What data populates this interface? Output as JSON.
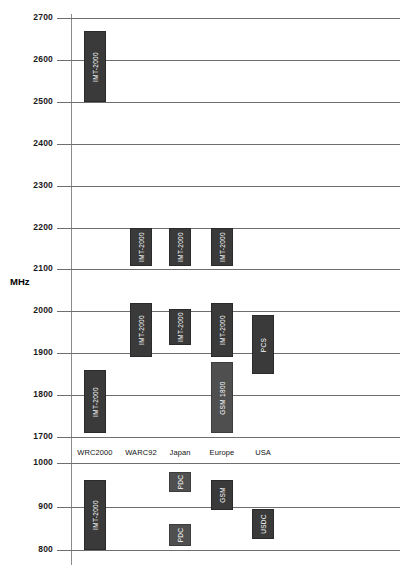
{
  "chart_data": {
    "type": "bar",
    "title": "",
    "xlabel": "",
    "ylabel": "MHz",
    "grid": true,
    "legend": "none",
    "orientation": "vertical-range-bars",
    "categories": [
      "WRC2000",
      "WARC92",
      "Japan",
      "Europe",
      "USA"
    ],
    "panels": [
      {
        "name": "upper",
        "ylim": [
          1700,
          2700
        ],
        "ticks": [
          1700,
          1800,
          1900,
          2000,
          2100,
          2200,
          2300,
          2400,
          2500,
          2600,
          2700
        ]
      },
      {
        "name": "lower",
        "ylim": [
          800,
          1000
        ],
        "ticks": [
          800,
          900,
          1000
        ]
      }
    ],
    "bars": [
      {
        "category": "WRC2000",
        "panel": "upper",
        "label": "IMT-2000",
        "low": 2500,
        "high": 2670,
        "shade": "dark"
      },
      {
        "category": "WRC2000",
        "panel": "upper",
        "label": "IMT-2000",
        "low": 1710,
        "high": 1860,
        "shade": "dark"
      },
      {
        "category": "WARC92",
        "panel": "upper",
        "label": "IMT-2000",
        "low": 2110,
        "high": 2200,
        "shade": "dark"
      },
      {
        "category": "WARC92",
        "panel": "upper",
        "label": "IMT-2000",
        "low": 1890,
        "high": 2020,
        "shade": "dark"
      },
      {
        "category": "Japan",
        "panel": "upper",
        "label": "IMT-2000",
        "low": 2110,
        "high": 2200,
        "shade": "dark"
      },
      {
        "category": "Japan",
        "panel": "upper",
        "label": "IMT-2000",
        "low": 1920,
        "high": 2005,
        "shade": "dark"
      },
      {
        "category": "Europe",
        "panel": "upper",
        "label": "IMT-2000",
        "low": 2110,
        "high": 2200,
        "shade": "dark"
      },
      {
        "category": "Europe",
        "panel": "upper",
        "label": "IMT-2000",
        "low": 1890,
        "high": 2020,
        "shade": "dark"
      },
      {
        "category": "Europe",
        "panel": "upper",
        "label": "GSM 1800",
        "low": 1710,
        "high": 1880,
        "shade": "light"
      },
      {
        "category": "USA",
        "panel": "upper",
        "label": "PCS",
        "low": 1850,
        "high": 1990,
        "shade": "dark"
      },
      {
        "category": "WRC2000",
        "panel": "lower",
        "label": "IMT-2000",
        "low": 800,
        "high": 960,
        "shade": "dark"
      },
      {
        "category": "Japan",
        "panel": "lower",
        "label": "PDC",
        "low": 935,
        "high": 980,
        "shade": "light"
      },
      {
        "category": "Japan",
        "panel": "lower",
        "label": "PDC",
        "low": 810,
        "high": 860,
        "shade": "light"
      },
      {
        "category": "Europe",
        "panel": "lower",
        "label": "GSM",
        "low": 890,
        "high": 960,
        "shade": "dark"
      },
      {
        "category": "USA",
        "panel": "lower",
        "label": "USDC",
        "low": 825,
        "high": 895,
        "shade": "dark"
      }
    ],
    "colors": {
      "bar_dark": "#3a3a3a",
      "bar_light": "#4f4f4f",
      "gridline": "#6e6e6e",
      "axis": "#8a8a8a",
      "text": "#1a1a1a",
      "bar_text": "#ffffff",
      "background": "#ffffff"
    }
  }
}
